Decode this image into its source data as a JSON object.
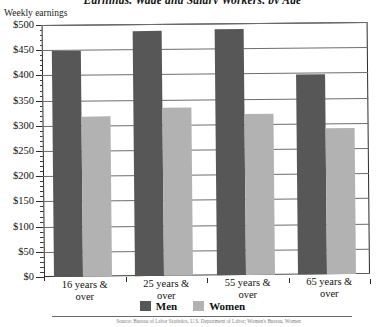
{
  "chart_data": {
    "type": "bar",
    "title": "Earnings, Wage and Salary Workers, by Age",
    "subtitle": "",
    "xlabel": "",
    "ylabel": "Weekly earnings",
    "ylim": [
      0,
      500
    ],
    "ytick_step": 50,
    "yminor_step": 10,
    "grid": true,
    "legend_position": "bottom-center",
    "categories": [
      "16 years & over",
      "25 years & over",
      "55 years & over",
      "65 years & over"
    ],
    "series": [
      {
        "name": "Men",
        "color": "#575757",
        "values": [
          448,
          487,
          489,
          396
        ]
      },
      {
        "name": "Women",
        "color": "#b2b2b2",
        "values": [
          318,
          333,
          320,
          290
        ]
      }
    ],
    "ytick_labels": [
      "$0",
      "$50",
      "$100",
      "$150",
      "$200",
      "$250",
      "$300",
      "$350",
      "$400",
      "$450",
      "$500"
    ],
    "annotations": []
  },
  "axes": {
    "y_caption": "Weekly earnings",
    "y_ticks": [
      {
        "value": 500,
        "label": "$500"
      },
      {
        "value": 450,
        "label": "$450"
      },
      {
        "value": 400,
        "label": "$400"
      },
      {
        "value": 350,
        "label": "$350"
      },
      {
        "value": 300,
        "label": "$300"
      },
      {
        "value": 250,
        "label": "$250"
      },
      {
        "value": 200,
        "label": "$200"
      },
      {
        "value": 150,
        "label": "$150"
      },
      {
        "value": 100,
        "label": "$100"
      },
      {
        "value": 50,
        "label": "$50"
      },
      {
        "value": 0,
        "label": "$0"
      }
    ]
  },
  "legend": {
    "items": [
      {
        "label": "Men",
        "color": "#575757"
      },
      {
        "label": "Women",
        "color": "#b2b2b2"
      }
    ]
  },
  "footnote": {
    "text": "Source: Bureau of Labor Statistics, U.S. Department of Labor; Women's Bureau, Women"
  },
  "colors": {
    "men": "#575757",
    "women": "#b2b2b2",
    "grid": "#6e6e6e",
    "axis": "#2b2b2b",
    "text": "#111111",
    "background": "#ffffff"
  }
}
